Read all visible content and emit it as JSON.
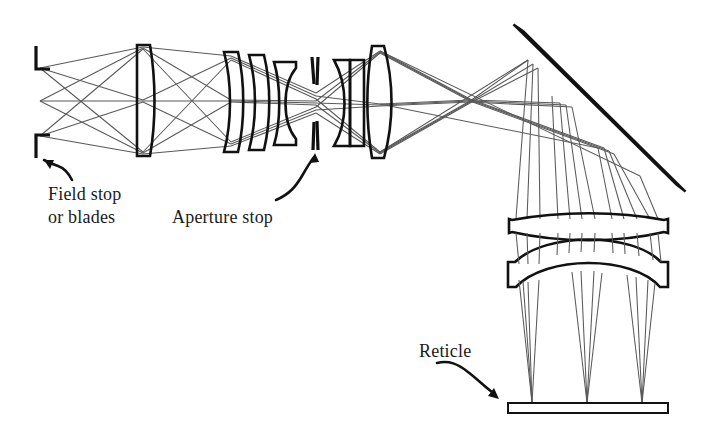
{
  "figure": {
    "background_color": "#ffffff",
    "ink_color": "#111111",
    "ray_color": "#595959",
    "width": 709,
    "height": 437
  },
  "labels": {
    "field_stop": "Field stop\nor blades",
    "aperture_stop": "Aperture stop",
    "reticle": "Reticle"
  },
  "annotations": [
    {
      "name": "field-stop-callout",
      "text": "Field stop\nor blades",
      "text_x": 48,
      "text_y": 183,
      "target_x": 38,
      "target_y": 158
    },
    {
      "name": "aperture-stop-callout",
      "text": "Aperture stop",
      "text_x": 172,
      "text_y": 206,
      "target_x": 316,
      "target_y": 152
    },
    {
      "name": "reticle-callout",
      "text": "Reticle",
      "text_x": 419,
      "text_y": 340,
      "target_x": 512,
      "target_y": 402
    }
  ],
  "optical_elements": [
    {
      "name": "field-stop-blade-upper",
      "type": "stop-blade",
      "x": 36,
      "y_top": 46,
      "y_bottom": 70
    },
    {
      "name": "field-stop-blade-lower",
      "type": "stop-blade",
      "x": 36,
      "y_top": 134,
      "y_bottom": 158
    },
    {
      "name": "objective-lens-1",
      "type": "plano-convex-lens",
      "x_center": 143,
      "y_top": 45,
      "y_bottom": 156,
      "thickness": 11
    },
    {
      "name": "relay-lens-2",
      "type": "meniscus-lens",
      "x_center": 231,
      "y_top": 52,
      "y_bottom": 152
    },
    {
      "name": "relay-lens-3",
      "type": "meniscus-lens",
      "x_center": 256,
      "y_top": 55,
      "y_bottom": 150
    },
    {
      "name": "relay-lens-4",
      "type": "meniscus-lens",
      "x_center": 285,
      "y_top": 62,
      "y_bottom": 145
    },
    {
      "name": "aperture-stop-blade-upper",
      "type": "stop-blade",
      "x": 315,
      "y_top": 58,
      "y_bottom": 85
    },
    {
      "name": "aperture-stop-blade-lower",
      "type": "stop-blade",
      "x": 315,
      "y_top": 120,
      "y_bottom": 150
    },
    {
      "name": "relay-lens-5",
      "type": "meniscus-lens",
      "x_center": 340,
      "y_top": 60,
      "y_bottom": 146
    },
    {
      "name": "relay-lens-6",
      "type": "meniscus-lens",
      "x_center": 356,
      "y_top": 58,
      "y_bottom": 148
    },
    {
      "name": "relay-lens-7",
      "type": "biconvex-lens",
      "x_center": 380,
      "y_top": 46,
      "y_bottom": 158
    },
    {
      "name": "fold-mirror",
      "type": "flat-mirror",
      "x1": 518,
      "y1": 28,
      "x2": 681,
      "y2": 188,
      "angle_deg": 45
    },
    {
      "name": "eyepiece-lens-upper",
      "type": "biconvex-lens",
      "x_left": 508,
      "x_right": 668,
      "y_center": 225
    },
    {
      "name": "eyepiece-lens-lower",
      "type": "meniscus-lens",
      "x_left": 508,
      "x_right": 668,
      "y_center": 265
    },
    {
      "name": "reticle-plate",
      "type": "flat-plate",
      "x_left": 508,
      "x_right": 668,
      "y_top": 403,
      "y_bottom": 413
    }
  ],
  "ray_bundles": [
    {
      "name": "ray-bundle-upper-field",
      "source_y": 68,
      "focus_x": 532
    },
    {
      "name": "ray-bundle-axial",
      "source_y": 101,
      "focus_x": 587
    },
    {
      "name": "ray-bundle-lower-field",
      "source_y": 136,
      "focus_x": 642
    }
  ]
}
